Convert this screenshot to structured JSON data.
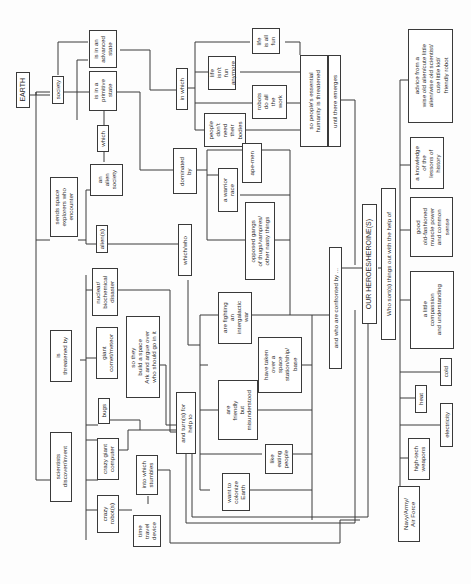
{
  "diagram": {
    "type": "flowchart",
    "orientation": "rotated-90-ccw-text",
    "nodes": {
      "earth": "EARTH",
      "sends_space_explorers": "sends space\nexplorers who\nencounter",
      "is_threatened_by": "is\nthreatened by",
      "scientists_discover": "scientists\ndiscover/invent",
      "society": "society",
      "is_in_advanced_state": "is in an\nadvanced\nstate",
      "is_in_primitive_state": "is in a\nprimitive\nstate",
      "which": "which",
      "an_alien_society": "an\nalien\nsociety",
      "aliens": "alien(s)",
      "nuclear_disaster": "nuclear/\nbiochemical\ndisaster",
      "giant_comet": "giant\ncomet/meteor",
      "so_they_build_ark": "so they\nbuild a space\nArk and argue over\nwho should go in it",
      "bugs": "bugs",
      "crazy_giant_computer": "crazy giant\ncomputer",
      "crazy_robots": "crazy\nrobot(s)",
      "time_travel_device": "time\ntravel\ndevice",
      "into_which_stumbles": "into which\nstumbles",
      "and_turns_for_help": "and turn(s) for\nhelp to",
      "in_which": "in which",
      "life_is_all_fun": "life\nis all\nfun",
      "life_isnt_fun": "life\nisn't\nfun\nanymore",
      "robots_do_all_work": "robots\ndo all\nthe\nwork",
      "people_dont_need_bodies": "people\ndon't\nneed\ntheir\nbodies",
      "essential_humanity_threatened": "so people's essential\nhumanity is threatened",
      "until_there_emerges": "until there emerges",
      "dominated_by": "dominated\nby",
      "ape_men": "ape-men",
      "warrior_race": "a warrior\nrace",
      "opposed_gangs": "opposed gangs\nof thugs/vampires/\nother nasty things",
      "which_who": "which/who",
      "fighting_intergalactic_war": "are fighting\nan\nintergalactic\nwar",
      "taken_over_space_station": "have taken\nover a\nspace\nstation/ship/\nbase",
      "friendly_misunderstood": "are\nfriendly\nbut\nmisunderstood",
      "like_eating_people": "like\neating\npeople",
      "want_to_colonize": "want to\ncolonize\nEarth",
      "confronted_by": "and who are confronted by ...",
      "our_heroes": "OUR HEROES/HEROINE(S)",
      "who_sorts_things_out": "Who sort(s) things out with the help of",
      "advice_from_wise": "advice from a\nwise old alien/cute little\nalien/wise old scientist/\ncute little kid/\nfriendly robot",
      "knowledge_of_history": "a knowledge\nof the\nlessons of\nhistory",
      "muscle_power": "good\nold-fashioned\nmuscle power\nand common\nsense",
      "compassion": "a little\ncompassion\nand understanding",
      "cold": "cold",
      "heat": "heat",
      "electricity": "electricity",
      "high_tech_weapons": "high-tech\nweapons",
      "navy_army_airforce": "Navy/Army/\nAir Force"
    }
  }
}
